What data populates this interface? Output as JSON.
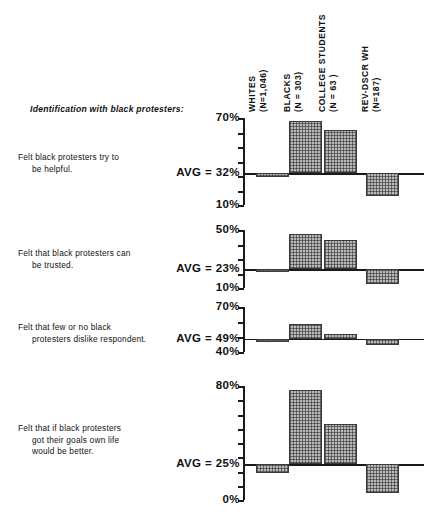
{
  "section": {
    "caption": "Identification with black protesters:"
  },
  "columns": [
    {
      "name": "whites",
      "line1": "WHITES",
      "line2": "(N=1,046)"
    },
    {
      "name": "blacks",
      "line1": "BLACKS",
      "line2": "(N = 303)"
    },
    {
      "name": "college-students",
      "line1": "COLLEGE STUDENTS",
      "line2": "(N = 63 )"
    },
    {
      "name": "rev-dscr-wh",
      "line1": "REV-DSCR  WH",
      "line2": "(N=187)"
    }
  ],
  "chart_data": {
    "type": "bar",
    "title": "Identification with black protesters:",
    "xlabel": "",
    "ylabel": "",
    "grid": false,
    "legend": "none",
    "note": "Deviation bar chart: each panel has its own axis; bars are drawn relative to the AVG baseline, extending up for above-average and down for below-average.",
    "categories": [
      "WHITES (N=1,046)",
      "BLACKS (N = 303)",
      "COLLEGE STUDENTS (N = 63 )",
      "REV-DSCR WH (N=187)"
    ],
    "panels": [
      {
        "id": "helpful",
        "label_lines": [
          "Felt black protesters try to",
          "be helpful."
        ],
        "avg": 32,
        "avg_label": "AVG = 32%",
        "top": 70,
        "top_label": "70%",
        "bottom": 10,
        "bottom_label": "10%",
        "ylim": [
          10,
          70
        ],
        "ticks": [
          10,
          20,
          30,
          40,
          50,
          60,
          70
        ],
        "values": [
          29,
          68,
          62,
          16
        ]
      },
      {
        "id": "trusted",
        "label_lines": [
          "Felt that black protesters can",
          "be trusted."
        ],
        "avg": 23,
        "avg_label": "AVG = 23%",
        "top": 50,
        "top_label": "50%",
        "bottom": 10,
        "bottom_label": "10%",
        "ylim": [
          10,
          50
        ],
        "ticks": [
          10,
          20,
          30,
          40,
          50
        ],
        "values": [
          21,
          47,
          43,
          13
        ]
      },
      {
        "id": "dislike-respondent",
        "label_lines": [
          "Felt that few or no black",
          "protesters dislike respondent."
        ],
        "avg": 49,
        "avg_label": "AVG = 49%",
        "top": 70,
        "top_label": "70%",
        "bottom": 40,
        "bottom_label": "40%",
        "ylim": [
          40,
          70
        ],
        "ticks": [
          40,
          50,
          60,
          70
        ],
        "values": [
          48,
          59,
          52,
          45
        ]
      },
      {
        "id": "goals-better-life",
        "label_lines": [
          "Felt that if black protesters",
          "got their goals own life",
          "would be better."
        ],
        "avg": 25,
        "avg_label": "AVG = 25%",
        "top": 80,
        "top_label": "80%",
        "bottom": 0,
        "bottom_label": "0%",
        "ylim": [
          0,
          80
        ],
        "ticks": [
          0,
          10,
          20,
          30,
          40,
          50,
          60,
          70,
          80
        ],
        "values": [
          19,
          77,
          53,
          5
        ]
      }
    ]
  },
  "colors": {
    "ink": "#111111",
    "axis": "#1a1a1a",
    "bar_fill": "#b9b9b9",
    "bar_border": "#3a3a3a",
    "background": "#ffffff"
  }
}
